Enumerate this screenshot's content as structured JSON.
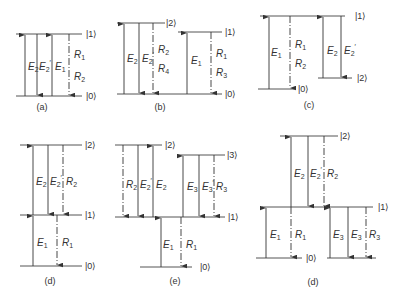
{
  "figure": {
    "panels": [
      {
        "id": "a",
        "caption": "(a)",
        "caption_pos": [
          42,
          110
        ],
        "levels": [
          {
            "ket": "|1⟩",
            "y": 34,
            "x1": 16,
            "x2": 82,
            "ket_x": 86
          },
          {
            "ket": "|0⟩",
            "y": 96,
            "x1": 16,
            "x2": 82,
            "ket_x": 86
          }
        ],
        "arrows": [
          {
            "label": "E",
            "sub": "2",
            "prime": false,
            "x": 25,
            "y_from": 96,
            "y_to": 34,
            "dir": "up",
            "style": "solid",
            "lx": 28,
            "ly": 70
          },
          {
            "label": "E",
            "sub": "2",
            "prime": true,
            "x": 37,
            "y_from": 34,
            "y_to": 96,
            "dir": "down",
            "style": "solid",
            "lx": 39,
            "ly": 70
          },
          {
            "label": "E",
            "sub": "1",
            "prime": false,
            "x": 52,
            "y_from": 96,
            "y_to": 34,
            "dir": "up",
            "style": "solid",
            "lx": 55,
            "ly": 70
          },
          {
            "label": "R",
            "sub": "1",
            "prime": false,
            "x": 69,
            "y_from": 34,
            "y_to": 96,
            "dir": "down",
            "style": "dashed",
            "lx": 74,
            "ly": 58,
            "label2": "R",
            "sub2": "2",
            "lx2": 74,
            "ly2": 80
          }
        ]
      },
      {
        "id": "b",
        "caption": "(b)",
        "caption_pos": [
          160,
          110
        ],
        "levels": [
          {
            "ket": "|2⟩",
            "y": 23,
            "x1": 117,
            "x2": 165,
            "ket_x": 166
          },
          {
            "ket": "|1⟩",
            "y": 32,
            "x1": 178,
            "x2": 222,
            "ket_x": 225
          },
          {
            "ket": "|0⟩",
            "y": 94,
            "x1": 117,
            "x2": 222,
            "ket_x": 225
          }
        ],
        "arrows": [
          {
            "label": "E",
            "sub": "2",
            "prime": false,
            "x": 124,
            "y_from": 94,
            "y_to": 23,
            "dir": "up",
            "style": "solid",
            "lx": 127,
            "ly": 62
          },
          {
            "label": "E",
            "sub": "2",
            "prime": true,
            "x": 139,
            "y_from": 23,
            "y_to": 94,
            "dir": "down",
            "style": "solid",
            "lx": 142,
            "ly": 62
          },
          {
            "label": "R",
            "sub": "2",
            "prime": false,
            "x": 153,
            "y_from": 23,
            "y_to": 94,
            "dir": "down",
            "style": "dashed",
            "lx": 158,
            "ly": 53,
            "label2": "R",
            "sub2": "4",
            "lx2": 158,
            "ly2": 72
          },
          {
            "label": "E",
            "sub": "1",
            "prime": false,
            "x": 187,
            "y_from": 94,
            "y_to": 32,
            "dir": "up",
            "style": "solid",
            "lx": 191,
            "ly": 64
          },
          {
            "label": "R",
            "sub": "1",
            "prime": false,
            "x": 211,
            "y_from": 32,
            "y_to": 94,
            "dir": "down",
            "style": "dashed",
            "lx": 216,
            "ly": 57,
            "label2": "R",
            "sub2": "3",
            "lx2": 216,
            "ly2": 76
          }
        ]
      },
      {
        "id": "c",
        "caption": "(c)",
        "caption_pos": [
          309,
          108
        ],
        "levels": [
          {
            "ket": "|1⟩",
            "y": 16,
            "x1": 260,
            "x2": 345,
            "ket_x": 355
          },
          {
            "ket": "|2⟩",
            "y": 78,
            "x1": 318,
            "x2": 352,
            "ket_x": 357
          },
          {
            "ket": "|0⟩",
            "y": 89,
            "x1": 258,
            "x2": 295,
            "ket_x": 298
          }
        ],
        "arrows": [
          {
            "label": "E",
            "sub": "1",
            "prime": false,
            "x": 269,
            "y_from": 89,
            "y_to": 16,
            "dir": "up",
            "style": "solid",
            "lx": 271,
            "ly": 56
          },
          {
            "label": "R",
            "sub": "1",
            "prime": false,
            "x": 290,
            "y_from": 16,
            "y_to": 89,
            "dir": "down",
            "style": "dashed",
            "lx": 295,
            "ly": 48,
            "label2": "R",
            "sub2": "2",
            "lx2": 295,
            "ly2": 67
          },
          {
            "label": "E",
            "sub": "2",
            "prime": false,
            "x": 323,
            "y_from": 78,
            "y_to": 16,
            "dir": "up",
            "style": "solid",
            "lx": 327,
            "ly": 54
          },
          {
            "label": "E",
            "sub": "2",
            "prime": true,
            "x": 341,
            "y_from": 16,
            "y_to": 78,
            "dir": "down",
            "style": "solid",
            "lx": 344,
            "ly": 54
          }
        ]
      },
      {
        "id": "d",
        "caption": "(d)",
        "caption_pos": [
          50,
          284
        ],
        "levels": [
          {
            "ket": "|2⟩",
            "y": 145,
            "x1": 20,
            "x2": 82,
            "ket_x": 85
          },
          {
            "ket": "|1⟩",
            "y": 215,
            "x1": 20,
            "x2": 82,
            "ket_x": 85
          },
          {
            "ket": "|0⟩",
            "y": 266,
            "x1": 20,
            "x2": 82,
            "ket_x": 85
          }
        ],
        "arrows": [
          {
            "label": "E",
            "sub": "2",
            "prime": false,
            "x": 33,
            "y_from": 215,
            "y_to": 145,
            "dir": "up",
            "style": "solid",
            "lx": 36,
            "ly": 185
          },
          {
            "label": "E",
            "sub": "2",
            "prime": true,
            "x": 48,
            "y_from": 145,
            "y_to": 215,
            "dir": "down",
            "style": "solid",
            "lx": 50,
            "ly": 185
          },
          {
            "label": "R",
            "sub": "2",
            "prime": false,
            "x": 63,
            "y_from": 145,
            "y_to": 215,
            "dir": "down",
            "style": "dashed",
            "lx": 66,
            "ly": 185
          },
          {
            "label": "E",
            "sub": "1",
            "prime": false,
            "x": 33,
            "y_from": 266,
            "y_to": 215,
            "dir": "up",
            "style": "solid",
            "lx": 37,
            "ly": 246
          },
          {
            "label": "R",
            "sub": "1",
            "prime": false,
            "x": 57,
            "y_from": 215,
            "y_to": 266,
            "dir": "down",
            "style": "dashed",
            "lx": 62,
            "ly": 246
          }
        ]
      },
      {
        "id": "e",
        "caption": "(e)",
        "caption_pos": [
          175,
          284
        ],
        "levels": [
          {
            "ket": "|2⟩",
            "y": 145,
            "x1": 115,
            "x2": 162,
            "ket_x": 165
          },
          {
            "ket": "|3⟩",
            "y": 155,
            "x1": 177,
            "x2": 225,
            "ket_x": 227
          },
          {
            "ket": "|1⟩",
            "y": 217,
            "x1": 115,
            "x2": 225,
            "ket_x": 228
          },
          {
            "ket": "|0⟩",
            "y": 267,
            "x1": 140,
            "x2": 192,
            "ket_x": 200
          }
        ],
        "arrows": [
          {
            "label": "R",
            "sub": "2",
            "prime": false,
            "x": 123,
            "y_from": 145,
            "y_to": 217,
            "dir": "down",
            "style": "dashed",
            "lx": 126,
            "ly": 188
          },
          {
            "label": "E",
            "sub": "2",
            "prime": true,
            "x": 138,
            "y_from": 145,
            "y_to": 217,
            "dir": "down",
            "style": "solid",
            "lx": 140,
            "ly": 188
          },
          {
            "label": "E",
            "sub": "2",
            "prime": false,
            "x": 153,
            "y_from": 217,
            "y_to": 145,
            "dir": "up",
            "style": "solid",
            "lx": 156,
            "ly": 188
          },
          {
            "label": "E",
            "sub": "3",
            "prime": false,
            "x": 183,
            "y_from": 217,
            "y_to": 155,
            "dir": "up",
            "style": "solid",
            "lx": 187,
            "ly": 190
          },
          {
            "label": "E",
            "sub": "3",
            "prime": true,
            "x": 199,
            "y_from": 155,
            "y_to": 217,
            "dir": "down",
            "style": "solid",
            "lx": 202,
            "ly": 190
          },
          {
            "label": "R",
            "sub": "3",
            "prime": false,
            "x": 214,
            "y_from": 155,
            "y_to": 217,
            "dir": "down",
            "style": "dashed",
            "lx": 216,
            "ly": 190
          },
          {
            "label": "E",
            "sub": "1",
            "prime": false,
            "x": 161,
            "y_from": 267,
            "y_to": 217,
            "dir": "up",
            "style": "solid",
            "lx": 163,
            "ly": 248
          },
          {
            "label": "R",
            "sub": "1",
            "prime": false,
            "x": 181,
            "y_from": 217,
            "y_to": 267,
            "dir": "down",
            "style": "dashed",
            "lx": 186,
            "ly": 248
          }
        ]
      },
      {
        "id": "f",
        "caption": "(d)",
        "caption_pos": [
          313,
          285
        ],
        "levels": [
          {
            "ket": "|2⟩",
            "y": 136,
            "x1": 280,
            "x2": 338,
            "ket_x": 340
          },
          {
            "ket": "|1⟩",
            "y": 207,
            "x1": 262,
            "x2": 373,
            "ket_x": 378
          },
          {
            "ket": "|0⟩",
            "y": 258,
            "x1": 256,
            "x2": 302,
            "ket_x": 306
          },
          {
            "ket": "",
            "y": 258,
            "x1": 327,
            "x2": 376,
            "ket_x": 0
          }
        ],
        "arrows": [
          {
            "label": "E",
            "sub": "2",
            "prime": false,
            "x": 291,
            "y_from": 207,
            "y_to": 136,
            "dir": "up",
            "style": "solid",
            "lx": 294,
            "ly": 177
          },
          {
            "label": "E",
            "sub": "2",
            "prime": true,
            "x": 308,
            "y_from": 136,
            "y_to": 207,
            "dir": "down",
            "style": "solid",
            "lx": 310,
            "ly": 177
          },
          {
            "label": "R",
            "sub": "2",
            "prime": false,
            "x": 324,
            "y_from": 136,
            "y_to": 207,
            "dir": "down",
            "style": "dashed",
            "lx": 327,
            "ly": 177
          },
          {
            "label": "E",
            "sub": "1",
            "prime": false,
            "x": 266,
            "y_from": 258,
            "y_to": 207,
            "dir": "up",
            "style": "solid",
            "lx": 270,
            "ly": 238
          },
          {
            "label": "R",
            "sub": "1",
            "prime": false,
            "x": 291,
            "y_from": 207,
            "y_to": 258,
            "dir": "down",
            "style": "dashed",
            "lx": 295,
            "ly": 238
          },
          {
            "label": "E",
            "sub": "3",
            "prime": false,
            "x": 330,
            "y_from": 258,
            "y_to": 207,
            "dir": "up",
            "style": "solid",
            "lx": 333,
            "ly": 238
          },
          {
            "label": "E",
            "sub": "3",
            "prime": false,
            "x": 348,
            "y_from": 207,
            "y_to": 258,
            "dir": "down",
            "style": "solid",
            "lx": 351,
            "ly": 238
          },
          {
            "label": "R",
            "sub": "3",
            "prime": false,
            "x": 366,
            "y_from": 207,
            "y_to": 258,
            "dir": "down",
            "style": "dashed",
            "lx": 369,
            "ly": 238
          }
        ]
      }
    ]
  }
}
